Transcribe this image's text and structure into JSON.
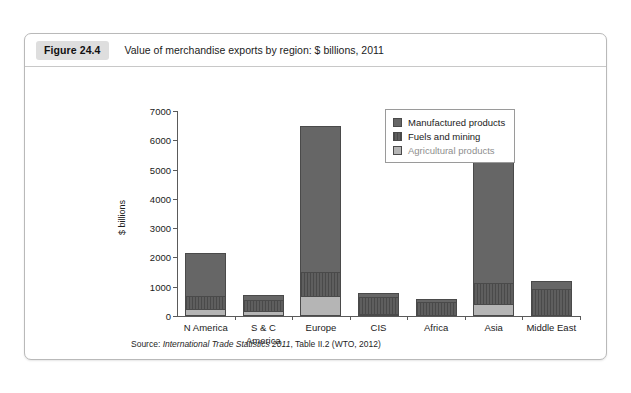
{
  "figure": {
    "badge": "Figure 24.4",
    "title": "Value of merchandise exports by region: $ billions, 2011",
    "source_prefix": "Source: ",
    "source_italic": "International Trade Statistics 2011",
    "source_rest": ", Table II.2 (WTO, 2012)"
  },
  "legend": {
    "items": [
      {
        "label": "Manufactured products",
        "key": "manufactured",
        "color": "#666666"
      },
      {
        "label": "Fuels and mining",
        "key": "fuels",
        "color": "#545454"
      },
      {
        "label": "Agricultural products",
        "key": "agricultural",
        "color": "#b5b5b5"
      }
    ]
  },
  "chart_data": {
    "type": "bar",
    "stacked": true,
    "title": "Value of merchandise exports by region: $ billions, 2011",
    "xlabel": "",
    "ylabel": "$ billions",
    "ylim": [
      0,
      7000
    ],
    "yticks": [
      0,
      1000,
      2000,
      3000,
      4000,
      5000,
      6000,
      7000
    ],
    "ytick_labels": [
      "0",
      "1000",
      "2000",
      "3000",
      "4000",
      "5000",
      "6000",
      "7000"
    ],
    "grid": false,
    "legend_position": "upper right",
    "categories": [
      "N America",
      "S & C America",
      "Europe",
      "CIS",
      "Africa",
      "Asia",
      "Middle East"
    ],
    "category_lines": [
      [
        "N America"
      ],
      [
        "S & C",
        "America"
      ],
      [
        "Europe"
      ],
      [
        "CIS"
      ],
      [
        "Africa"
      ],
      [
        "Asia"
      ],
      [
        "Middle East"
      ]
    ],
    "series": [
      {
        "name": "Agricultural products",
        "values": [
          250,
          180,
          680,
          70,
          50,
          420,
          30
        ]
      },
      {
        "name": "Fuels and mining",
        "values": [
          420,
          350,
          820,
          570,
          440,
          700,
          900
        ]
      },
      {
        "name": "Manufactured products",
        "values": [
          1480,
          200,
          5000,
          140,
          90,
          4280,
          250
        ]
      }
    ],
    "totals": [
      2150,
      730,
      6500,
      780,
      580,
      5400,
      1180
    ]
  }
}
